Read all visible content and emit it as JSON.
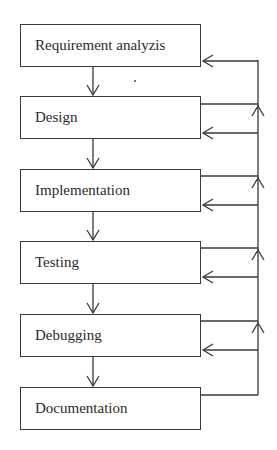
{
  "diagram": {
    "type": "flowchart",
    "title": "",
    "stages": [
      {
        "id": "req",
        "label": "Requirement analyzis"
      },
      {
        "id": "design",
        "label": "Design"
      },
      {
        "id": "impl",
        "label": "Implementation"
      },
      {
        "id": "test",
        "label": "Testing"
      },
      {
        "id": "debug",
        "label": "Debugging"
      },
      {
        "id": "doc",
        "label": "Documentation"
      }
    ],
    "edges": [
      {
        "from": "req",
        "to": "design",
        "kind": "forward"
      },
      {
        "from": "design",
        "to": "impl",
        "kind": "forward"
      },
      {
        "from": "impl",
        "to": "test",
        "kind": "forward"
      },
      {
        "from": "test",
        "to": "debug",
        "kind": "forward"
      },
      {
        "from": "debug",
        "to": "doc",
        "kind": "forward"
      },
      {
        "from": "design",
        "to": "feedback-bus",
        "kind": "feedback-out"
      },
      {
        "from": "impl",
        "to": "feedback-bus",
        "kind": "feedback-out"
      },
      {
        "from": "test",
        "to": "feedback-bus",
        "kind": "feedback-out"
      },
      {
        "from": "debug",
        "to": "feedback-bus",
        "kind": "feedback-out"
      },
      {
        "from": "doc",
        "to": "feedback-bus",
        "kind": "feedback-out"
      },
      {
        "from": "feedback-bus",
        "to": "req",
        "kind": "feedback-in"
      },
      {
        "from": "feedback-bus",
        "to": "design",
        "kind": "feedback-in"
      },
      {
        "from": "feedback-bus",
        "to": "impl",
        "kind": "feedback-in"
      },
      {
        "from": "feedback-bus",
        "to": "test",
        "kind": "feedback-in"
      },
      {
        "from": "feedback-bus",
        "to": "debug",
        "kind": "feedback-in"
      }
    ],
    "colors": {
      "line": "#3a3a3a",
      "text": "#2a2a2a",
      "background": "#ffffff"
    }
  }
}
